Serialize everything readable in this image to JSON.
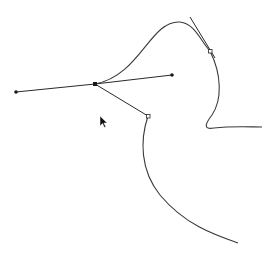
{
  "canvas": {
    "width": 276,
    "height": 256,
    "background": "#ffffff",
    "stroke_color": "#3a3a3a",
    "handle_color": "#2a2a2a"
  },
  "path": {
    "segments": [
      "M 95 84 C 140 76, 150 20, 180 22 C 195 24, 200 40, 210 51 C 222 75, 222 100, 212 115 C 205 124, 203 130, 214 128 C 232 126, 250 127, 262 127",
      "M 148 116 C 140 140, 140 170, 160 195 C 185 225, 215 235, 238 243"
    ]
  },
  "anchors": [
    {
      "name": "anchor-main",
      "x": 95,
      "y": 84,
      "type": "selected"
    },
    {
      "name": "anchor-upper-right",
      "x": 210,
      "y": 51,
      "type": "open"
    },
    {
      "name": "anchor-lower",
      "x": 148,
      "y": 116,
      "type": "open"
    }
  ],
  "handles": [
    {
      "name": "handle-left",
      "x1": 95,
      "y1": 84,
      "x2": 16,
      "y2": 92
    },
    {
      "name": "handle-right",
      "x1": 95,
      "y1": 84,
      "x2": 172,
      "y2": 75
    },
    {
      "name": "handle-lower",
      "x1": 95,
      "y1": 84,
      "x2": 148,
      "y2": 116
    },
    {
      "name": "handle-upper-right",
      "x1": 190,
      "y1": 17,
      "x2": 215,
      "y2": 58
    }
  ],
  "cursor": {
    "x": 100,
    "y": 116,
    "icon": "arrow-pointer-icon"
  }
}
